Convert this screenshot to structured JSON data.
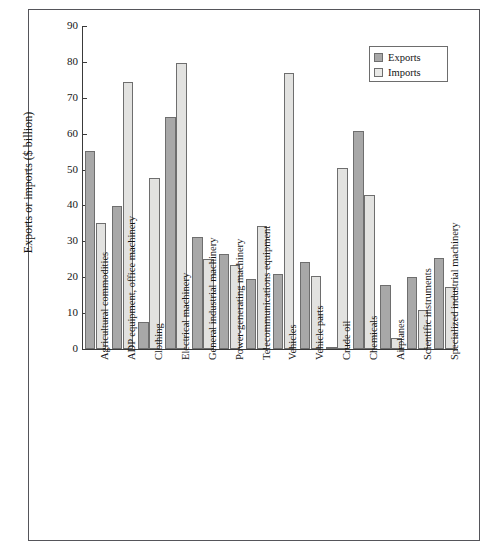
{
  "chart_data": {
    "type": "bar",
    "title": "",
    "xlabel": "",
    "ylabel": "Exports or imports ($ billion)",
    "ylim": [
      0,
      90
    ],
    "yticks": [
      0,
      10,
      20,
      30,
      40,
      50,
      60,
      70,
      80,
      90
    ],
    "grid": false,
    "legend_position": "top-right",
    "categories": [
      "Agricultural commodities",
      "ADP equipment, office machinery",
      "Clothing",
      "Electrical machinery",
      "General industrial machinery",
      "Power-generating machinery",
      "Telecommunications equipment",
      "Vehicles",
      "Vehicle parts",
      "Crude oil",
      "Chemicals",
      "Airplanes",
      "Scientific instruments",
      "Specialized industrial machinery"
    ],
    "series": [
      {
        "name": "Exports",
        "color": "#a8a8a8",
        "values": [
          55.3,
          39.8,
          7.6,
          64.6,
          31.1,
          26.4,
          19.5,
          21.0,
          24.3,
          0.5,
          60.8,
          17.9,
          20.0,
          25.4
        ]
      },
      {
        "name": "Imports",
        "color": "#e2e2e0",
        "values": [
          35.2,
          74.4,
          47.6,
          79.6,
          25.1,
          23.5,
          34.4,
          77.0,
          20.3,
          50.5,
          43.0,
          3.1,
          11.0,
          17.4
        ]
      }
    ]
  },
  "legend": {
    "items": [
      {
        "label": "Exports"
      },
      {
        "label": "Imports"
      }
    ]
  }
}
